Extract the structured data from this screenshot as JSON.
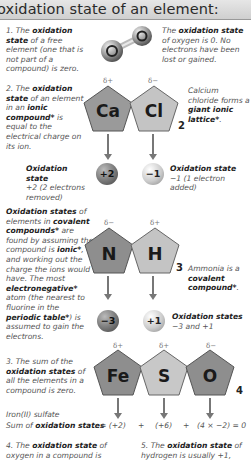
{
  "title": "oxidation state of an element:",
  "rule1": {
    "text_parts": [
      "1. The ",
      "oxidation state",
      " of a free element (one that is not part of a compound) is zero."
    ],
    "side_parts": [
      "The ",
      "oxidation state",
      " of oxygen is 0. No electrons have been lost or gained."
    ],
    "molecule": "O2"
  },
  "rule2": {
    "text_parts": [
      "2. The ",
      "oxidation state",
      " of an element in an ",
      "ionic compound*",
      " is equal to the electrical charge on its ion."
    ],
    "side_parts": [
      "Calcium chloride forms a ",
      "giant ionic lattice*",
      "."
    ],
    "atoms": [
      {
        "symbol": "Ca",
        "delta": "δ+",
        "color": "#9a9a9a"
      },
      {
        "symbol": "Cl",
        "delta": "δ−",
        "color": "#c4c4c4"
      }
    ],
    "subscript": "2",
    "charges": [
      {
        "value": "+2",
        "label": "Oxidation state",
        "desc": "+2 (2 electrons removed)"
      },
      {
        "value": "−1",
        "label": "Oxidation state",
        "desc": "−1 (1 electron added)"
      }
    ]
  },
  "covalent": {
    "text_parts": [
      "Oxidation states",
      " of elements in ",
      "covalent compounds*",
      " are found by assuming the compound is ",
      "ionic*",
      ", and working out the charge the ions would have. The most ",
      "electronegative*",
      " atom (the nearest to fluorine in the ",
      "periodic table*",
      ") is assumed to gain the electrons."
    ],
    "side_parts": [
      "Ammonia is a ",
      "covalent compound*",
      "."
    ],
    "atoms": [
      {
        "symbol": "N",
        "delta": "δ−",
        "color": "#8e8e8e"
      },
      {
        "symbol": "H",
        "delta": "δ+",
        "color": "#c4c4c4"
      }
    ],
    "subscript": "3",
    "charges": [
      {
        "value": "−3"
      },
      {
        "value": "+1"
      }
    ],
    "result_label": "Oxidation states",
    "result_desc": "−3 and +1"
  },
  "rule3": {
    "text_parts": [
      "3. The sum of the ",
      "oxidation states",
      " of all the elements in a compound is zero."
    ],
    "atoms": [
      {
        "symbol": "Fe",
        "delta": "δ+",
        "color": "#8e8e8e"
      },
      {
        "symbol": "S",
        "delta": "δ+",
        "color": "#c8c8c8"
      },
      {
        "symbol": "O",
        "delta": "δ−",
        "color": "#8e8e8e"
      }
    ],
    "subscript": "4",
    "compound_name": "Iron(II) sulfate",
    "sum_prefix": "Sum of ",
    "sum_bold": "oxidation states",
    "sum_terms": [
      "= (+2)",
      "+",
      "(+6)",
      "+",
      "(4 × −2) = 0"
    ]
  },
  "rule4": {
    "text_parts": [
      "4. The ",
      "oxidation state",
      " of oxygen in a compound is"
    ]
  },
  "rule5": {
    "text_parts": [
      "5. The ",
      "oxidation state",
      " of hydrogen is usually +1,"
    ]
  }
}
